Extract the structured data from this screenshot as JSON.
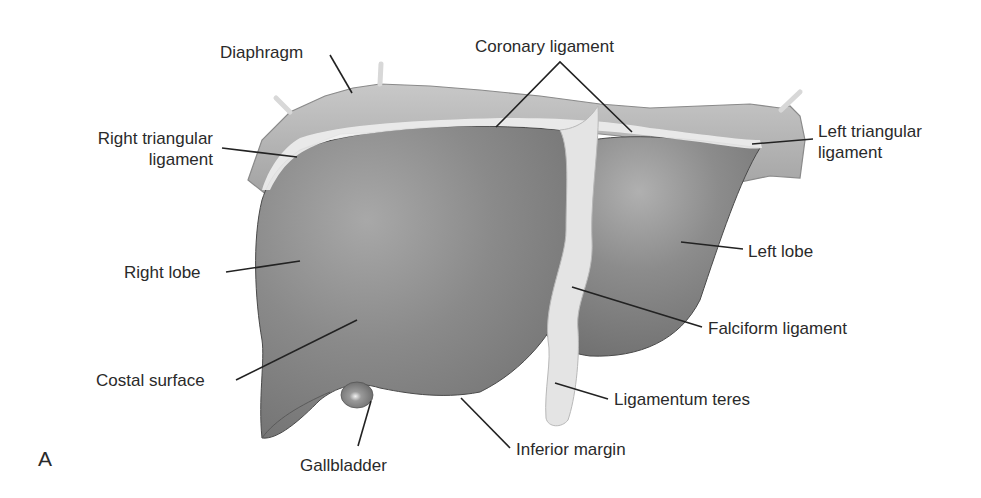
{
  "figure": {
    "panel_letter": "A",
    "colors": {
      "liver_fill": "#8a8a8a",
      "liver_dark": "#6e6e6e",
      "ligament_fill": "#e6e6e6",
      "diaphragm_fill": "#b4b4b4",
      "leader_line": "#222222",
      "text": "#2a2a2a"
    }
  },
  "labels": {
    "diaphragm": "Diaphragm",
    "coronary_ligament": "Coronary ligament",
    "right_triangular_ligament_line1": "Right triangular",
    "right_triangular_ligament_line2": "ligament",
    "left_triangular_ligament_line1": "Left triangular",
    "left_triangular_ligament_line2": "ligament",
    "right_lobe": "Right lobe",
    "left_lobe": "Left lobe",
    "falciform_ligament": "Falciform ligament",
    "costal_surface": "Costal surface",
    "ligamentum_teres": "Ligamentum teres",
    "gallbladder": "Gallbladder",
    "inferior_margin": "Inferior margin"
  }
}
